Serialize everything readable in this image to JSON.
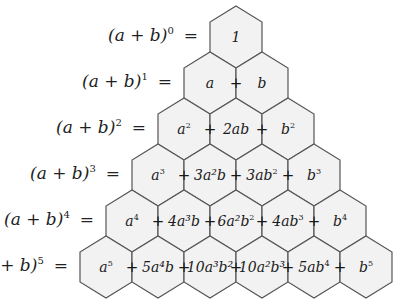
{
  "diagram": {
    "hex_fill": "#f2f2f2",
    "hex_stroke": "#555555",
    "rows": [
      {
        "lhs_base": "(a + b)",
        "lhs_exp": "0",
        "equals": "=",
        "terms": [
          {
            "t": "1",
            "e": ""
          }
        ]
      },
      {
        "lhs_base": "(a + b)",
        "lhs_exp": "1",
        "equals": "=",
        "terms": [
          {
            "t": "a",
            "e": ""
          },
          {
            "t": "b",
            "e": ""
          }
        ]
      },
      {
        "lhs_base": "(a + b)",
        "lhs_exp": "2",
        "equals": "=",
        "terms": [
          {
            "t": "a",
            "e": "2"
          },
          {
            "t": "2ab",
            "e": ""
          },
          {
            "t": "b",
            "e": "2"
          }
        ]
      },
      {
        "lhs_base": "(a + b)",
        "lhs_exp": "3",
        "equals": "=",
        "terms": [
          {
            "t": "a",
            "e": "3"
          },
          {
            "t": "3a²b",
            "e": ""
          },
          {
            "t": "3ab",
            "e": "2"
          },
          {
            "t": "b",
            "e": "3"
          }
        ]
      },
      {
        "lhs_base": "(a + b)",
        "lhs_exp": "4",
        "equals": "=",
        "terms": [
          {
            "t": "a",
            "e": "4"
          },
          {
            "t": "4a³b",
            "e": ""
          },
          {
            "t": "6a²b",
            "e": "2"
          },
          {
            "t": "4ab",
            "e": "3"
          },
          {
            "t": "b",
            "e": "4"
          }
        ]
      },
      {
        "lhs_base": "+ b)",
        "lhs_exp": "5",
        "equals": "=",
        "terms": [
          {
            "t": "a",
            "e": "5"
          },
          {
            "t": "5a⁴b",
            "e": ""
          },
          {
            "t": "10a³b²",
            "e": ""
          },
          {
            "t": "10a²b³",
            "e": ""
          },
          {
            "t": "5ab",
            "e": "4"
          },
          {
            "t": "b",
            "e": "5"
          }
        ]
      }
    ],
    "plus_sign": "+"
  }
}
